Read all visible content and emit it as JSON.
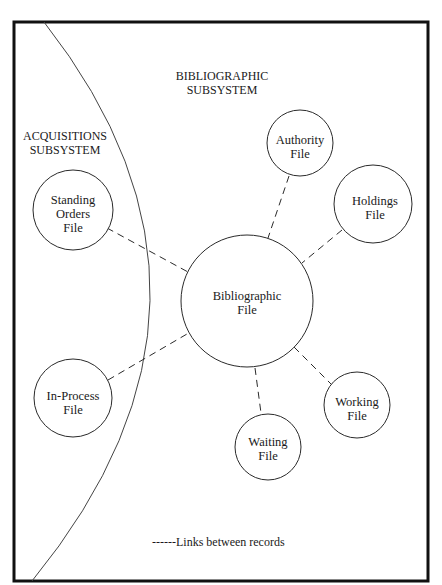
{
  "diagram": {
    "regions": {
      "bibliographic": {
        "line1": "BIBLIOGRAPHIC",
        "line2": "SUBSYSTEM"
      },
      "acquisitions": {
        "line1": "ACQUISITIONS",
        "line2": "SUBSYSTEM"
      }
    },
    "nodes": {
      "bibliographic": {
        "line1": "Bibliographic",
        "line2": "File"
      },
      "authority": {
        "line1": "Authority",
        "line2": "File"
      },
      "holdings": {
        "line1": "Holdings",
        "line2": "File"
      },
      "standing_orders": {
        "line1": "Standing",
        "line2": "Orders",
        "line3": "File"
      },
      "in_process": {
        "line1": "In-Process",
        "line2": "File"
      },
      "waiting": {
        "line1": "Waiting",
        "line2": "File"
      },
      "working": {
        "line1": "Working",
        "line2": "File"
      }
    },
    "links": [
      {
        "from": "Bibliographic File",
        "to": "Authority File",
        "style": "dashed"
      },
      {
        "from": "Bibliographic File",
        "to": "Holdings File",
        "style": "dashed"
      },
      {
        "from": "Bibliographic File",
        "to": "Standing Orders File",
        "style": "dashed"
      },
      {
        "from": "Bibliographic File",
        "to": "In-Process File",
        "style": "dashed"
      },
      {
        "from": "Bibliographic File",
        "to": "Waiting File",
        "style": "dashed"
      },
      {
        "from": "Bibliographic File",
        "to": "Working File",
        "style": "dashed"
      }
    ],
    "legend": {
      "text": "------Links between records"
    },
    "colors": {
      "line": "#2a2a2a",
      "border": "#111111",
      "background": "#ffffff"
    }
  }
}
